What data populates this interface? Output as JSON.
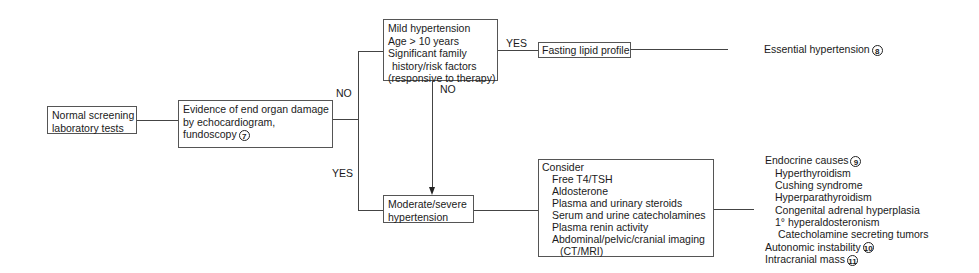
{
  "diagram": {
    "type": "flowchart",
    "nodes": {
      "screening": {
        "lines": [
          "Normal screening",
          "laboratory tests"
        ]
      },
      "evidence": {
        "lines": [
          "Evidence of end organ damage",
          "by echocardiogram,",
          "fundoscopy"
        ],
        "ref": "7"
      },
      "mild": {
        "lines": [
          "Mild hypertension",
          "Age > 10 years",
          "Significant family",
          "history/risk factors",
          "(responsive to therapy)"
        ]
      },
      "lipid": {
        "label": "Fasting lipid profile"
      },
      "essential": {
        "label": "Essential hypertension",
        "ref": "8"
      },
      "moderate": {
        "lines": [
          "Moderate/severe",
          "hypertension"
        ]
      },
      "consider": {
        "title": "Consider",
        "items": [
          "Free T4/TSH",
          "Aldosterone",
          "Plasma and urinary steroids",
          "Serum and urine catecholamines",
          "Plasma renin activity",
          "Abdominal/pelvic/cranial imaging",
          "(CT/MRI)"
        ]
      },
      "outcomes": {
        "endocrine": {
          "label": "Endocrine causes",
          "ref": "9",
          "items": [
            "Hyperthyroidism",
            "Cushing syndrome",
            "Hyperparathyroidism",
            "Congenital adrenal hyperplasia",
            "1° hyperaldosteronism",
            "Catecholamine secreting tumors"
          ]
        },
        "autonomic": {
          "label": "Autonomic instability",
          "ref": "10"
        },
        "intracranial": {
          "label": "Intracranial mass",
          "ref": "11"
        }
      }
    },
    "edge_labels": {
      "evidence_no": "NO",
      "evidence_yes": "YES",
      "mild_yes": "YES",
      "mild_no": "NO"
    }
  }
}
